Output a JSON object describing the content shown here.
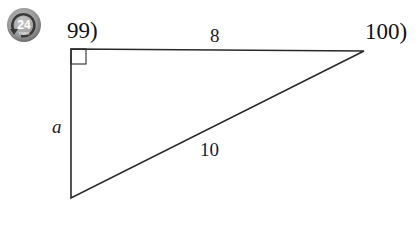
{
  "badge": {
    "number": "24",
    "subtext": "TIMES",
    "icon": "circular-arrow-icon"
  },
  "problems": [
    {
      "number_label": "99)"
    },
    {
      "number_label": "100)"
    }
  ],
  "triangle": {
    "type": "right-triangle",
    "right_angle_at": "top-left",
    "vertices": {
      "top_left": [
        71,
        49
      ],
      "top_right": [
        364,
        51
      ],
      "bottom_left": [
        71,
        198
      ]
    },
    "sides": {
      "top": "8",
      "left": "a",
      "hypotenuse": "10"
    },
    "stroke_color": "#2a2a2a"
  }
}
